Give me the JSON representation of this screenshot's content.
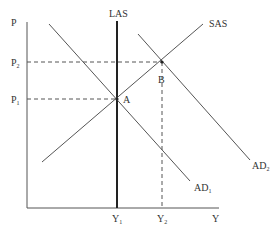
{
  "diagram": {
    "type": "AD-AS model",
    "axes": {
      "y_label": "P",
      "x_label": "Y"
    },
    "curves": [
      {
        "id": "LAS",
        "label": "LAS"
      },
      {
        "id": "SAS",
        "label": "SAS"
      },
      {
        "id": "AD1",
        "label": "AD",
        "sub": "1"
      },
      {
        "id": "AD2",
        "label": "AD",
        "sub": "2"
      }
    ],
    "points": [
      {
        "id": "A",
        "label": "A"
      },
      {
        "id": "B",
        "label": "B"
      }
    ],
    "price_levels": [
      {
        "label": "P",
        "sub": "1"
      },
      {
        "label": "P",
        "sub": "2"
      }
    ],
    "output_levels": [
      {
        "label": "Y",
        "sub": "1"
      },
      {
        "label": "Y",
        "sub": "2"
      }
    ],
    "colors": {
      "line": "#444444",
      "las": "#222222",
      "text": "#333333"
    }
  }
}
